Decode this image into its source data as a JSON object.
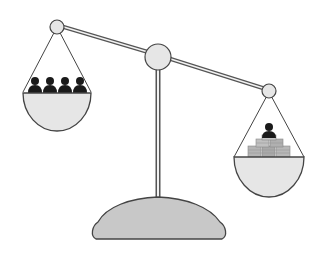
{
  "illustration": {
    "subject": "balance-scale",
    "description": "Unbalanced scale: left pan holds four people, right pan holds one person on a pile of coins and is heavier",
    "left_pan": {
      "contents": "people",
      "count": 4
    },
    "right_pan": {
      "contents": "person-on-coins",
      "count": 1
    },
    "colors": {
      "background": "#ffffff",
      "fill_light": "#e6e6e6",
      "base_fill": "#c8c8c8",
      "stroke": "#444444",
      "person": "#1a1a1a",
      "coin": "#b5b5b5"
    }
  }
}
